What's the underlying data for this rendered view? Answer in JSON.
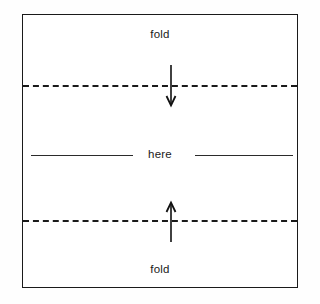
{
  "diagram": {
    "paper": {
      "border_color": "#1a1a1a",
      "background_color": "#ffffff"
    },
    "labels": {
      "top_fold": "fold",
      "middle_here": "here",
      "bottom_fold": "fold"
    },
    "fold_lines": [
      {
        "name": "upper-fold-line",
        "style": "dashed",
        "color": "#1a1a1a"
      },
      {
        "name": "lower-fold-line",
        "style": "dashed",
        "color": "#1a1a1a"
      }
    ],
    "rules": [
      {
        "name": "middle-rule-left",
        "style": "solid",
        "color": "#2b2b2b"
      },
      {
        "name": "middle-rule-right",
        "style": "solid",
        "color": "#2b2b2b"
      }
    ],
    "arrows": [
      {
        "name": "down-arrow",
        "direction": "down",
        "color": "#111111"
      },
      {
        "name": "up-arrow",
        "direction": "up",
        "color": "#111111"
      }
    ]
  }
}
